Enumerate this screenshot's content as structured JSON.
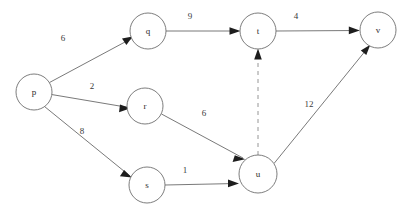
{
  "diagram": {
    "background_color": "#ffffff",
    "node_stroke_color": "#6e6e6e",
    "edge_color": "#6a6a6a",
    "arrow_color": "#1d1d1d",
    "nodes": [
      {
        "id": "p",
        "label": "p",
        "cx": 34,
        "cy": 92,
        "r": 18
      },
      {
        "id": "q",
        "label": "q",
        "cx": 148,
        "cy": 31,
        "r": 18
      },
      {
        "id": "r",
        "label": "r",
        "cx": 145,
        "cy": 106,
        "r": 18
      },
      {
        "id": "s",
        "label": "s",
        "cx": 147,
        "cy": 185,
        "r": 18
      },
      {
        "id": "t",
        "label": "t",
        "cx": 258,
        "cy": 31,
        "r": 18
      },
      {
        "id": "u",
        "label": "u",
        "cx": 258,
        "cy": 174,
        "r": 19
      },
      {
        "id": "v",
        "label": "v",
        "cx": 378,
        "cy": 30,
        "r": 18
      }
    ],
    "edges": [
      {
        "from": "p",
        "to": "q",
        "weight": "6",
        "style": "solid",
        "label_x": 63,
        "label_y": 38
      },
      {
        "from": "p",
        "to": "r",
        "weight": "2",
        "style": "solid",
        "label_x": 92,
        "label_y": 86
      },
      {
        "from": "p",
        "to": "s",
        "weight": "8",
        "style": "solid",
        "label_x": 82,
        "label_y": 131
      },
      {
        "from": "q",
        "to": "t",
        "weight": "9",
        "style": "solid",
        "label_x": 190,
        "label_y": 16
      },
      {
        "from": "t",
        "to": "v",
        "weight": "4",
        "style": "solid",
        "label_x": 296,
        "label_y": 16
      },
      {
        "from": "r",
        "to": "u",
        "weight": "6",
        "style": "solid",
        "label_x": 204,
        "label_y": 113
      },
      {
        "from": "s",
        "to": "u",
        "weight": "1",
        "style": "solid",
        "label_x": 185,
        "label_y": 170
      },
      {
        "from": "u",
        "to": "v",
        "weight": "12",
        "style": "solid",
        "label_x": 309,
        "label_y": 104
      },
      {
        "from": "u",
        "to": "t",
        "weight": "",
        "style": "dashed",
        "label_x": 0,
        "label_y": 0
      }
    ]
  }
}
